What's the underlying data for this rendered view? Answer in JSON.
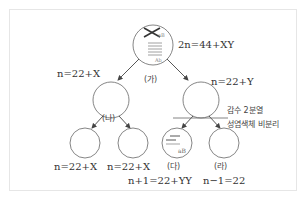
{
  "diagram": {
    "title": "",
    "cells": {
      "ga": {
        "label": "(가)",
        "formula": "2n=44+XY",
        "alleles": [
          "aB",
          "Ab"
        ]
      },
      "left_secondary": {
        "formula": "n=22+X"
      },
      "right_secondary": {
        "formula": "n=22+Y"
      },
      "na": {
        "label": "(나)"
      },
      "ll": {
        "formula": "n=22+X"
      },
      "lr": {
        "formula": "n=22+X"
      },
      "da": {
        "label": "(다)",
        "formula": "n+1=22+YY",
        "allele": "aB"
      },
      "ra": {
        "label": "(라)",
        "formula": "n−1=22"
      }
    },
    "annotation": {
      "line1": "감수 2분열",
      "line2": "성염색체 비분리"
    },
    "colors": {
      "stroke": "#555555",
      "text": "#333333",
      "border": "#e6e6e6"
    }
  }
}
